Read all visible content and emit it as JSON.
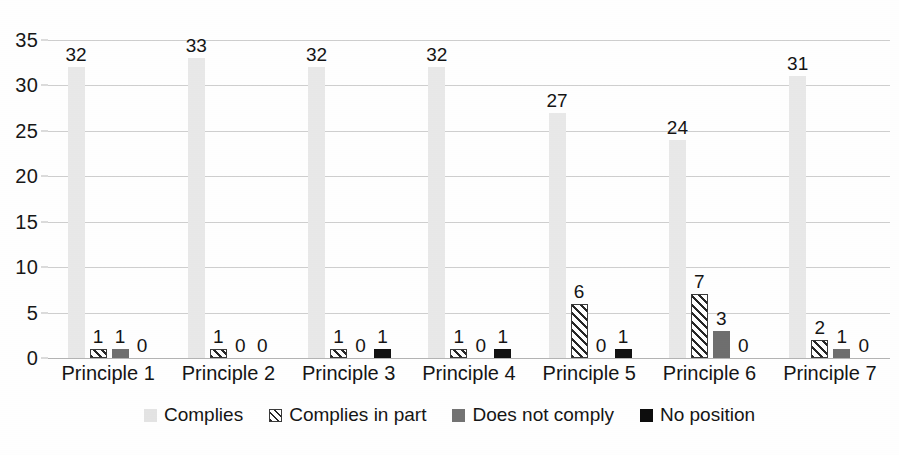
{
  "chart_data": {
    "type": "bar",
    "title": "",
    "subtitle": "",
    "xlabel": "",
    "ylabel": "",
    "categories": [
      "Principle 1",
      "Principle 2",
      "Principle 3",
      "Principle 4",
      "Principle 5",
      "Principle 6",
      "Principle 7"
    ],
    "series": [
      {
        "name": "Complies",
        "color": "#e9e9e9",
        "values": [
          32,
          33,
          32,
          32,
          27,
          24,
          31
        ]
      },
      {
        "name": "Complies in part",
        "color": "#ffffff",
        "pattern": "diagonal-hatch",
        "values": [
          1,
          1,
          1,
          1,
          6,
          7,
          2
        ]
      },
      {
        "name": "Does not comply",
        "color": "#6f6f6f",
        "values": [
          1,
          0,
          0,
          0,
          0,
          3,
          1
        ]
      },
      {
        "name": "No position",
        "color": "#111111",
        "values": [
          0,
          0,
          1,
          1,
          1,
          0,
          0
        ]
      }
    ],
    "ylim": [
      0,
      35
    ],
    "ytick_step": 5,
    "yticks": [
      "0",
      "5",
      "10",
      "15",
      "20",
      "25",
      "30",
      "35"
    ],
    "grid": true,
    "data_labels": true,
    "legend_position": "bottom"
  },
  "legend": {
    "items": [
      {
        "label": "Complies"
      },
      {
        "label": "Complies in part"
      },
      {
        "label": "Does not comply"
      },
      {
        "label": "No position"
      }
    ]
  }
}
